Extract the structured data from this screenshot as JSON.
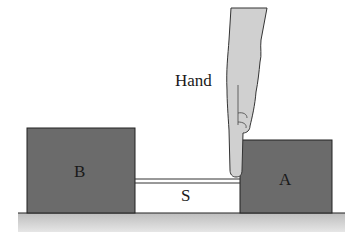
{
  "diagram": {
    "labels": {
      "hand": "Hand",
      "block_b": "B",
      "block_a": "A",
      "string": "S"
    },
    "colors": {
      "block": "#6b6b6b",
      "hand": "#d0d0d0",
      "floor": "#c8c8c8",
      "outline": "#222222"
    }
  }
}
